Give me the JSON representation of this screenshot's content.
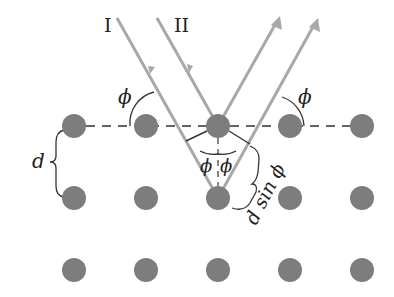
{
  "diagram": {
    "colors": {
      "atom": "#7d7d7d",
      "ray": "#a8a8a8",
      "dashed_plane": "#333333",
      "annotation": "#333333",
      "text": "#222222"
    },
    "lattice": {
      "columns_x": [
        74,
        146,
        218,
        290,
        362
      ],
      "rows_y": [
        126,
        198,
        270
      ],
      "atom_radius": 12
    },
    "rays": [
      {
        "id": "ray-I-incident",
        "label": "I",
        "from": [
          117,
          18
        ],
        "to": [
          218,
          198
        ]
      },
      {
        "id": "ray-II-incident",
        "label": "II",
        "from": [
          157,
          18
        ],
        "to": [
          218,
          126
        ]
      },
      {
        "id": "ray-II-reflected",
        "from": [
          218,
          126
        ],
        "to": [
          279,
          17
        ]
      },
      {
        "id": "ray-I-reflected",
        "from": [
          218,
          198
        ],
        "to": [
          318,
          19
        ]
      }
    ],
    "labels": {
      "ray_I": "I",
      "ray_II": "II",
      "phi_left": "ϕ",
      "phi_right": "ϕ",
      "phi_center_left": "ϕ",
      "phi_center_right": "ϕ",
      "spacing": "d",
      "path_difference": "d sin ϕ"
    }
  }
}
